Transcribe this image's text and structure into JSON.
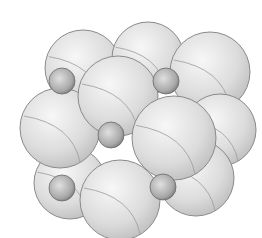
{
  "figure": {
    "colors": {
      "background": "#ffffff",
      "large_sphere_light": "#f2f2f2",
      "large_sphere_dark": "#bdbdbd",
      "small_sphere_light": "#d6d6d6",
      "small_sphere_dark": "#7d7d7d",
      "outline": "#8a8a8a"
    },
    "large_spheres": [
      {
        "cx": 83,
        "cy": 68,
        "r": 38
      },
      {
        "cx": 148,
        "cy": 58,
        "r": 36
      },
      {
        "cx": 210,
        "cy": 72,
        "r": 40
      },
      {
        "cx": 220,
        "cy": 130,
        "r": 36
      },
      {
        "cx": 196,
        "cy": 178,
        "r": 38
      },
      {
        "cx": 70,
        "cy": 183,
        "r": 36
      },
      {
        "cx": 60,
        "cy": 128,
        "r": 40
      },
      {
        "cx": 118,
        "cy": 96,
        "r": 40
      },
      {
        "cx": 174,
        "cy": 138,
        "r": 42
      },
      {
        "cx": 120,
        "cy": 200,
        "r": 40
      }
    ],
    "small_spheres": [
      {
        "cx": 62,
        "cy": 81,
        "r": 13
      },
      {
        "cx": 166,
        "cy": 81,
        "r": 13
      },
      {
        "cx": 111,
        "cy": 135,
        "r": 13
      },
      {
        "cx": 62,
        "cy": 188,
        "r": 13
      },
      {
        "cx": 163,
        "cy": 187,
        "r": 13
      }
    ]
  }
}
